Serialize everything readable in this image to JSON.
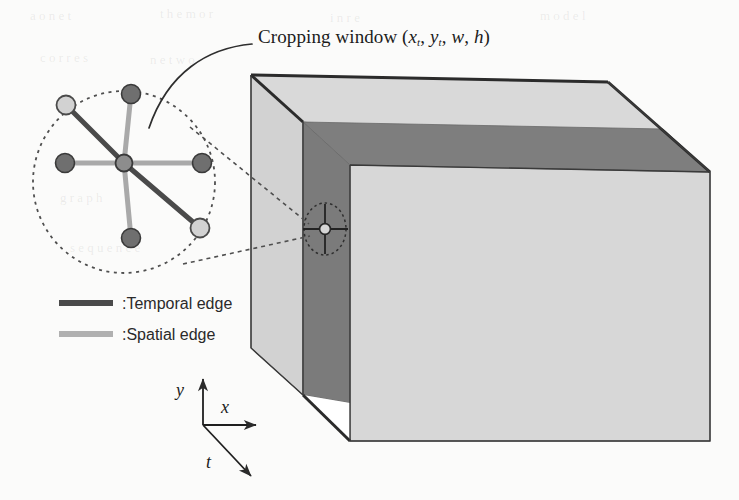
{
  "figure": {
    "title": "Cropping window",
    "title_params_open": "(",
    "title_params": "x_t, y_t, w, h",
    "title_params_close": ")",
    "title_full": "Cropping window (x_t, y_t, w, h)",
    "param_x": "x",
    "param_x_sub": "t",
    "param_y": "y",
    "param_y_sub": "t",
    "param_w": "w",
    "param_h": "h",
    "comma": ",",
    "legend": [
      {
        "label": ":Temporal edge",
        "color": "#4a4a4a",
        "style": "solid-dark"
      },
      {
        "label": ":Spatial edge",
        "color": "#b0b0b0",
        "style": "solid-light"
      }
    ],
    "axes": [
      {
        "name": "y",
        "label": "y",
        "direction": "up"
      },
      {
        "name": "x",
        "label": "x",
        "direction": "right"
      },
      {
        "name": "t",
        "label": "t",
        "direction": "down-right"
      }
    ],
    "colors": {
      "volume_face": "#d7d7d7",
      "volume_top": "#d9d9d9",
      "volume_side": "#cfcfcf",
      "slab_dark": "#7b7b7b",
      "outline": "#2b2b2b",
      "node_dark": "#6f6f6f",
      "node_light": "#d2d2d2",
      "temporal_edge": "#4a4a4a",
      "spatial_edge": "#a9a9a9",
      "dashed": "#5a5a5a",
      "background": "#fbfbfa"
    },
    "magnifier": {
      "name": "magnified-graph-node-neighborhood",
      "center_node": "center-node",
      "spatial_neighbors": 4,
      "temporal_neighbors": 2
    },
    "inset_marker": {
      "name": "cropping-window-marker",
      "description": "small dashed circle with cross on dark slab"
    },
    "bleed_text": [
      "a   o   n   e  t",
      "t h e   m    o r",
      "i  n    r e",
      "m  o   d  e l",
      "c  o   r  r e  s",
      "n  e   t  w  o",
      "t  e  m  p  o  r  a  l",
      "s  p  a  t  i  a  l",
      "f  r  a  m  e  s",
      "v  i  d  e  o",
      "t  h  e     p  r  o  p  o  s  e  d",
      "g  r  a  p  h",
      "r  e  p  r  e  s  e  n  t  a  t  i  o  n",
      "w  i  n  d  o  w",
      "s  e  q  u  e  n  c  e",
      "f  e  a  t  u  r  e"
    ]
  }
}
